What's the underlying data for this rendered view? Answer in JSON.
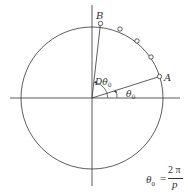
{
  "diagram": {
    "labels": {
      "point_a": "A",
      "point_b": "B",
      "angle_theta0": "θ",
      "angle_theta0_sub": "0",
      "angle_dtheta0": "Dθ",
      "angle_dtheta0_sub": "0"
    },
    "formula": {
      "lhs": "θ",
      "lhs_sub": "0",
      "equals": "=",
      "numerator": "2 π",
      "denominator": "p"
    },
    "colors": {
      "stroke": "#333333",
      "background": "#ffffff"
    }
  }
}
